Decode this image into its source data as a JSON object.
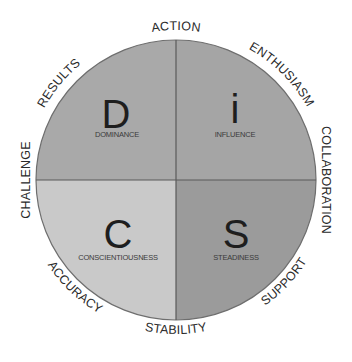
{
  "diagram": {
    "center": {
      "x": 176,
      "y": 180
    },
    "radius": 140,
    "colors": {
      "d_quadrant": "#a9a9a9",
      "i_quadrant": "#a6a6a6",
      "c_quadrant": "#c8c8c8",
      "s_quadrant": "#9a9a9a",
      "outline": "#6e6e6e",
      "text": "#222222"
    },
    "quadrants": [
      {
        "key": "D",
        "letter": "D",
        "label": "DOMINANCE"
      },
      {
        "key": "i",
        "letter": "i",
        "label": "INFLUENCE"
      },
      {
        "key": "C",
        "letter": "C",
        "label": "CONSCIENTIOUSNESS"
      },
      {
        "key": "S",
        "letter": "S",
        "label": "STEADINESS"
      }
    ],
    "ring_labels": [
      {
        "text": "ACTION",
        "angle": 0
      },
      {
        "text": "ENTHUSIASM",
        "angle": 40
      },
      {
        "text": "COLLABORATION",
        "angle": 90
      },
      {
        "text": "SUPPORT",
        "angle": 135
      },
      {
        "text": "STABILITY",
        "angle": 180
      },
      {
        "text": "ACCURACY",
        "angle": 225
      },
      {
        "text": "CHALLENGE",
        "angle": 270
      },
      {
        "text": "RESULTS",
        "angle": 315
      }
    ]
  }
}
